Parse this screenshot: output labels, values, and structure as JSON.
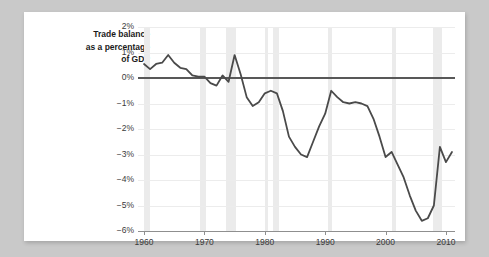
{
  "card": {
    "title_line1": "Trade balance",
    "title_line2": "as a percentage",
    "title_line3": "of GDP"
  },
  "colors": {
    "page_background": "#c9c9c9",
    "card_background": "#ffffff",
    "line": "#4a4a4a",
    "zero_line": "#585858",
    "recession_band": "#ebebeb",
    "gridline": "#ececec",
    "axis": "#8f8f8f",
    "text": "#3a3a3a"
  },
  "chart_data": {
    "type": "line",
    "xlabel": "",
    "ylabel": "Trade balance as a percentage of GDP",
    "xlim": [
      1959,
      2011.5
    ],
    "ylim": [
      -6,
      2
    ],
    "grid": true,
    "legend": "none",
    "ytick_labels": [
      "2%",
      "1%",
      "0%",
      "-1%",
      "-2%",
      "-3%",
      "-4%",
      "-5%",
      "-6%"
    ],
    "ytick_values": [
      2,
      1,
      0,
      -1,
      -2,
      -3,
      -4,
      -5,
      -6
    ],
    "xtick_labels": [
      "1960",
      "1970",
      "1980",
      "1990",
      "2000",
      "2010"
    ],
    "xtick_values": [
      1960,
      1970,
      1980,
      1990,
      2000,
      2010
    ],
    "series": [
      {
        "name": "Trade balance (% of GDP)",
        "x": [
          1960,
          1961,
          1962,
          1963,
          1964,
          1965,
          1966,
          1967,
          1968,
          1969,
          1970,
          1971,
          1972,
          1973,
          1974,
          1975,
          1976,
          1977,
          1978,
          1979,
          1980,
          1981,
          1982,
          1983,
          1984,
          1985,
          1986,
          1987,
          1988,
          1989,
          1990,
          1991,
          1992,
          1993,
          1994,
          1995,
          1996,
          1997,
          1998,
          1999,
          2000,
          2001,
          2002,
          2003,
          2004,
          2005,
          2006,
          2007,
          2008,
          2009,
          2010,
          2011
        ],
        "values": [
          0.55,
          0.35,
          0.55,
          0.6,
          0.9,
          0.6,
          0.4,
          0.35,
          0.1,
          0.05,
          0.05,
          -0.2,
          -0.3,
          0.1,
          -0.15,
          0.9,
          0.15,
          -0.75,
          -1.1,
          -0.95,
          -0.6,
          -0.5,
          -0.6,
          -1.3,
          -2.3,
          -2.7,
          -3.0,
          -3.1,
          -2.5,
          -1.9,
          -1.4,
          -0.5,
          -0.75,
          -0.95,
          -1.0,
          -0.95,
          -1.0,
          -1.1,
          -1.6,
          -2.3,
          -3.1,
          -2.9,
          -3.4,
          -3.9,
          -4.6,
          -5.2,
          -5.6,
          -5.5,
          -5.0,
          -2.7,
          -3.3,
          -2.9
        ]
      }
    ],
    "recession_bands": [
      {
        "start": 1960.0,
        "end": 1961.0
      },
      {
        "start": 1969.2,
        "end": 1970.2
      },
      {
        "start": 1973.5,
        "end": 1975.2
      },
      {
        "start": 1980.0,
        "end": 1980.6
      },
      {
        "start": 1981.3,
        "end": 1982.4
      },
      {
        "start": 1990.4,
        "end": 1991.2
      },
      {
        "start": 2001.0,
        "end": 2001.8
      },
      {
        "start": 2007.8,
        "end": 2009.3
      }
    ]
  }
}
